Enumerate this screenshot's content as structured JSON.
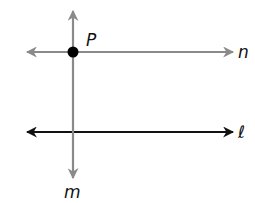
{
  "diagram": {
    "colors": {
      "line_n": "#8a8a8a",
      "line_m": "#8a8a8a",
      "line_l": "#111111",
      "point": "#000000"
    },
    "labels": {
      "point_p": "P",
      "line_n": "n",
      "line_l": "ℓ",
      "line_m": "m"
    },
    "lines": [
      {
        "name": "n",
        "orientation": "horizontal",
        "color": "gray",
        "passes_through": "P"
      },
      {
        "name": "ℓ",
        "orientation": "horizontal",
        "color": "black"
      },
      {
        "name": "m",
        "orientation": "vertical",
        "color": "gray",
        "passes_through": "P"
      }
    ],
    "points": [
      {
        "name": "P",
        "on_lines": [
          "n",
          "m"
        ]
      }
    ]
  }
}
